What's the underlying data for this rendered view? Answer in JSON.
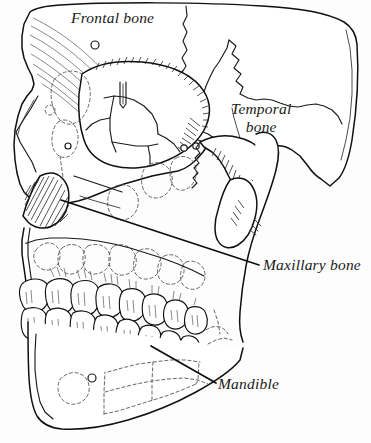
{
  "figure": {
    "style": "ink line drawing",
    "background_color": "#fdfdfd",
    "line_color": "#101010",
    "label_color": "#1a1a1a"
  },
  "labels": [
    {
      "id": "frontal",
      "text": "Frontal bone",
      "line1": "Frontal bone",
      "line2": "",
      "x": 71,
      "y": 9,
      "has_leader": false
    },
    {
      "id": "temporal",
      "text": "Temporal bone",
      "line1": "Temporal",
      "line2": "bone",
      "x": 231,
      "y": 100,
      "has_leader": false
    },
    {
      "id": "maxillary",
      "text": "Maxillary bone",
      "line1": "Maxillary bone",
      "line2": "",
      "x": 263,
      "y": 256,
      "has_leader": true
    },
    {
      "id": "mandible",
      "text": "Mandible",
      "line1": "Mandible",
      "line2": "",
      "x": 218,
      "y": 375,
      "has_leader": true
    }
  ],
  "leaders": [
    {
      "id": "maxillary-leader",
      "from_x": 61,
      "from_y": 200,
      "to_x": 259,
      "to_y": 265
    },
    {
      "id": "mandible-leader",
      "from_x": 151,
      "from_y": 346,
      "to_x": 216,
      "to_y": 383
    }
  ],
  "regions": [
    {
      "id": "cranial-vault",
      "name": "frontal bone / cranial vault"
    },
    {
      "id": "orbit",
      "name": "orbital cavity"
    },
    {
      "id": "nasal-aperture",
      "name": "nasal aperture (hatched)"
    },
    {
      "id": "zygomatic-arch",
      "name": "zygomatic arch"
    },
    {
      "id": "temporal-region",
      "name": "temporal bone"
    },
    {
      "id": "maxilla",
      "name": "maxillary bone"
    },
    {
      "id": "mandible-body",
      "name": "mandible"
    },
    {
      "id": "upper-teeth",
      "name": "maxillary dentition"
    },
    {
      "id": "lower-teeth",
      "name": "mandibular dentition"
    }
  ]
}
